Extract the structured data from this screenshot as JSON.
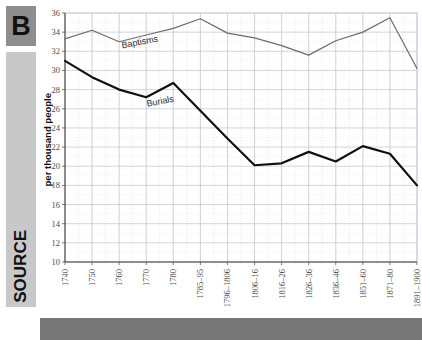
{
  "panel": {
    "badge": "B",
    "rail_label": "SOURCE"
  },
  "chart_data": {
    "type": "line",
    "title": "",
    "xlabel": "",
    "ylabel": "per thousand people",
    "ylim": [
      10,
      36
    ],
    "ytick_step": 2,
    "yticks": [
      10,
      12,
      14,
      16,
      18,
      20,
      22,
      24,
      26,
      28,
      30,
      32,
      34,
      36
    ],
    "grid": true,
    "legend": "inline-labels",
    "categories": [
      "1740",
      "1750",
      "1760",
      "1770",
      "1780",
      "1785–95",
      "1796–1806",
      "1806–16",
      "1816–26",
      "1826–36",
      "1836–46",
      "1851–60",
      "1871–80",
      "1891–1900"
    ],
    "series": [
      {
        "name": "Baptisms",
        "color": "#6b6b6b",
        "values": [
          33.3,
          34.2,
          33.0,
          33.7,
          34.4,
          35.4,
          33.9,
          33.4,
          32.6,
          31.6,
          33.1,
          34.0,
          35.5,
          30.2
        ]
      },
      {
        "name": "Burials",
        "color": "#101010",
        "values": [
          31.0,
          29.3,
          28.0,
          27.2,
          28.7,
          25.8,
          22.9,
          20.1,
          20.3,
          21.5,
          20.5,
          22.1,
          21.3,
          18.0
        ]
      }
    ],
    "annotations": [
      {
        "text": "Baptisms",
        "near_category": "1760"
      },
      {
        "text": "Burials",
        "near_category": "1770"
      }
    ]
  }
}
